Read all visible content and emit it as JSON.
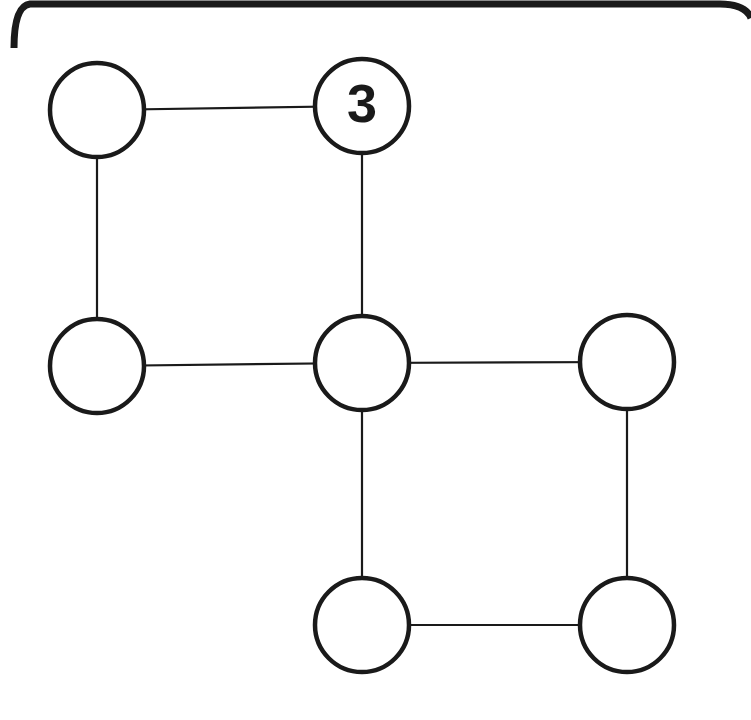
{
  "diagram": {
    "title": "",
    "type": "node-graph-puzzle",
    "colors": {
      "background": "#ffffff",
      "stroke": "#1a1a1a",
      "node_fill": "#ffffff",
      "label": "#1a1a1a"
    },
    "node_radius": 47,
    "nodes": [
      {
        "id": "n1",
        "x": 97,
        "y": 110,
        "label": ""
      },
      {
        "id": "n2",
        "x": 362,
        "y": 106,
        "label": "3"
      },
      {
        "id": "n3",
        "x": 97,
        "y": 366,
        "label": ""
      },
      {
        "id": "n4",
        "x": 362,
        "y": 363,
        "label": ""
      },
      {
        "id": "n5",
        "x": 627,
        "y": 362,
        "label": ""
      },
      {
        "id": "n6",
        "x": 362,
        "y": 625,
        "label": ""
      },
      {
        "id": "n7",
        "x": 627,
        "y": 625,
        "label": ""
      }
    ],
    "edges": [
      {
        "from": "n1",
        "to": "n2"
      },
      {
        "from": "n1",
        "to": "n3"
      },
      {
        "from": "n2",
        "to": "n4"
      },
      {
        "from": "n3",
        "to": "n4"
      },
      {
        "from": "n4",
        "to": "n5"
      },
      {
        "from": "n4",
        "to": "n6"
      },
      {
        "from": "n5",
        "to": "n7"
      },
      {
        "from": "n6",
        "to": "n7"
      }
    ]
  }
}
